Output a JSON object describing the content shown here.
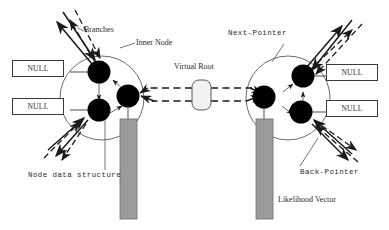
{
  "figure": {
    "background_color": "#ffffff",
    "ink_color": "#2b2b2b",
    "node_fill": "#000000",
    "vector_fill": "#9b9b9b"
  },
  "labels": {
    "branches": "Branches",
    "inner_node": "Inner Node",
    "virtual_root": "Virtual Root",
    "next_pointer": "Next-Pointer",
    "back_pointer": "Back-Pointer",
    "node_data_structure": "Node data structure",
    "likelihood_vector": "Likelihood Vector"
  },
  "null_boxes": [
    {
      "id": "null-top-left",
      "text": "NULL"
    },
    {
      "id": "null-bottom-left",
      "text": "NULL"
    },
    {
      "id": "null-top-right",
      "text": "NULL"
    },
    {
      "id": "null-bottom-right",
      "text": "NULL"
    }
  ],
  "nodes": {
    "left_group": [
      {
        "id": "left-node-upper",
        "label": ""
      },
      {
        "id": "left-node-lower",
        "label": ""
      },
      {
        "id": "left-node-right",
        "label": ""
      }
    ],
    "right_group": [
      {
        "id": "right-node-left",
        "label": ""
      },
      {
        "id": "right-node-upper",
        "label": ""
      },
      {
        "id": "right-node-lower",
        "label": ""
      }
    ]
  },
  "elements": {
    "virtual_root_shape": "rounded-rectangle",
    "likelihood_vectors": 2,
    "inner_node_circles": 2
  }
}
